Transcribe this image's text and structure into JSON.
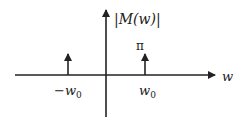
{
  "diagram": {
    "y_axis_label": "|M(w)|",
    "x_axis_label": "w",
    "impulse_height_label": "π",
    "impulses": [
      {
        "label_main": "−w",
        "label_sub": "0",
        "position": "-w0"
      },
      {
        "label_main": "w",
        "label_sub": "0",
        "position": "w0"
      }
    ]
  }
}
